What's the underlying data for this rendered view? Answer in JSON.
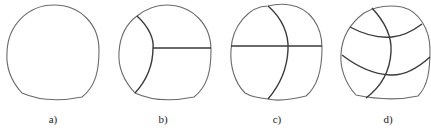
{
  "figure": {
    "panels": [
      {
        "id": "a",
        "label": "a)",
        "description": "Undivided rounded cross-section"
      },
      {
        "id": "b",
        "label": "b)",
        "description": "Curved left partition with horizontal right partition"
      },
      {
        "id": "c",
        "label": "c)",
        "description": "Full horizontal partition with curved vertical partition"
      },
      {
        "id": "d",
        "label": "d)",
        "description": "One curved vertical partition with two curved horizontal partitions"
      }
    ],
    "colors": {
      "outline": "#6a6a6a",
      "partition": "#3a3a3a",
      "background": "#ffffff"
    }
  }
}
